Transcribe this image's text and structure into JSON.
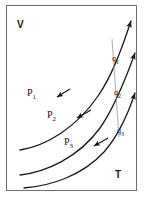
{
  "figure": {
    "kind": "thermodynamic-vt-diagram",
    "frame": {
      "stroke": "#6b6b72",
      "background": "#ffffff"
    },
    "axes": {
      "vertical_label": "V",
      "horizontal_label": "T"
    },
    "curves": [
      {
        "id": "p1",
        "label": "P",
        "subscript": "1",
        "stroke": "#1a1a1a",
        "path": "M 20 150 C 46 146 76 128 98 96 C 112 76 122 48 130 24",
        "arrow_tip": [
          131,
          21
        ],
        "arrow_angle": -68,
        "mid_arrow_tip": [
          58,
          96
        ],
        "mid_arrow_angle": 150
      },
      {
        "id": "p2",
        "label": "P",
        "subscript": "2",
        "stroke": "#1a1a1a",
        "path": "M 20 175 C 46 172 78 158 100 128 C 114 108 126 78 134 56",
        "arrow_tip": [
          135,
          53
        ],
        "arrow_angle": -68,
        "mid_arrow_tip": [
          78,
          117
        ],
        "mid_arrow_angle": 150
      },
      {
        "id": "p3",
        "label": "P",
        "subscript": "3",
        "stroke": "#1a1a1a",
        "path": "M 24 188 C 50 186 82 176 104 152 C 118 136 128 114 134 96",
        "arrow_tip": [
          135,
          93
        ],
        "arrow_angle": -68,
        "mid_arrow_tip": [
          95,
          145
        ],
        "mid_arrow_angle": 150
      }
    ],
    "crossing_line": {
      "id": "heat-line",
      "stroke": "#9a9aa0",
      "from": [
        112,
        39
      ],
      "to": [
        119,
        137
      ]
    },
    "heat_labels": [
      {
        "id": "q1",
        "text": "q",
        "subscript": "1"
      },
      {
        "id": "q2",
        "text": "q",
        "subscript": "2"
      },
      {
        "id": "q3",
        "text": "q",
        "subscript": "3"
      }
    ]
  }
}
